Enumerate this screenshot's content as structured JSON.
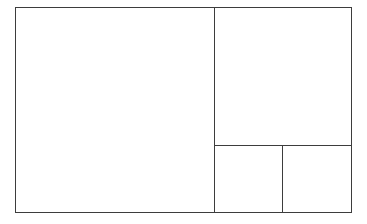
{
  "diagram": {
    "type": "layout-wireframe",
    "background_color": "#ffffff",
    "stroke_color": "#3d3d3d",
    "stroke_width_px": 1.3,
    "canvas": {
      "width_px": 367,
      "height_px": 224
    },
    "frame": {
      "left_px": 15,
      "top_px": 7,
      "width_px": 337,
      "height_px": 206
    },
    "regions": [
      {
        "id": "main",
        "label": "",
        "x_px": 0,
        "y_px": 0,
        "width_px": 200,
        "height_px": 206
      },
      {
        "id": "aside-top",
        "label": "",
        "x_px": 199,
        "y_px": 0,
        "width_px": 138,
        "height_px": 139
      },
      {
        "id": "aside-bottom-left",
        "label": "",
        "x_px": 199,
        "y_px": 138,
        "width_px": 69,
        "height_px": 68
      },
      {
        "id": "aside-bottom-right",
        "label": "",
        "x_px": 267,
        "y_px": 138,
        "width_px": 70,
        "height_px": 68
      }
    ],
    "dividers": [
      {
        "id": "vertical-main-aside",
        "orientation": "vertical",
        "position_px": 214
      },
      {
        "id": "horizontal-aside-split",
        "orientation": "horizontal",
        "position_px": 145
      },
      {
        "id": "vertical-aside-bottom-split",
        "orientation": "vertical",
        "position_px": 283
      }
    ]
  }
}
